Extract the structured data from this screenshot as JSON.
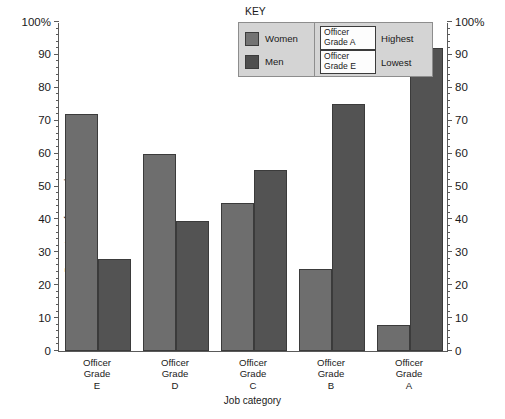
{
  "chart_data": {
    "type": "bar",
    "title": "",
    "xlabel": "Job category",
    "ylabel": "Percentage of men and women",
    "categories": [
      "Officer\nGrade\nE",
      "Officer\nGrade\nD",
      "Officer\nGrade\nC",
      "Officer\nGrade\nB",
      "Officer\nGrade\nA"
    ],
    "series": [
      {
        "name": "Women",
        "color": "#6e6e6e",
        "values": [
          72,
          60,
          45,
          25,
          8
        ]
      },
      {
        "name": "Men",
        "color": "#535353",
        "values": [
          28,
          39.5,
          55,
          75,
          92
        ]
      }
    ],
    "ylim": [
      0,
      100
    ],
    "yticks": [
      0,
      10,
      20,
      30,
      40,
      50,
      60,
      70,
      80,
      90,
      100
    ],
    "ytick_labels": [
      "0",
      "10",
      "20",
      "30",
      "40",
      "50",
      "60",
      "70",
      "80",
      "90",
      "100%"
    ],
    "ytick_labels_right": [
      "0",
      "10",
      "20",
      "30",
      "40",
      "50",
      "60",
      "70",
      "80",
      "90",
      "100%"
    ],
    "minor_tick_step": 2,
    "grid": false,
    "legend_position": "top-center-right",
    "dual_axis": true
  },
  "key": {
    "title": "KEY",
    "series_rows": [
      {
        "label": "Women",
        "swatch": "#737373"
      },
      {
        "label": "Men",
        "swatch": "#4e4e4e"
      }
    ],
    "rank_rows": [
      {
        "grade": "Officer\nGrade A",
        "rank": "Highest"
      },
      {
        "grade": "Officer\nGrade E",
        "rank": "Lowest"
      }
    ]
  }
}
